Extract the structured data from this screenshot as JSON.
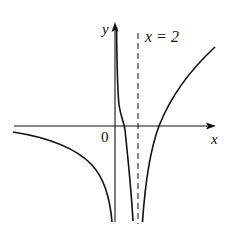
{
  "figure": {
    "type": "function-graph",
    "axes": {
      "x_label": "x",
      "y_label": "y",
      "origin_label": "0"
    },
    "asymptote": {
      "label": "x = 2",
      "style": "dashed",
      "x_value": 2
    },
    "curves": [
      {
        "name": "left-branch",
        "description": "approaches x-axis from below as x → -∞, decreases to -∞ as x → 0⁻"
      },
      {
        "name": "middle-branch",
        "description": "descends from +∞ near x = 0⁺, crosses x-axis, falls to -∞ as x → 2⁻"
      },
      {
        "name": "right-branch",
        "description": "rises from -∞ as x → 2⁺, crosses x-axis, increases"
      }
    ],
    "colors": {
      "stroke": "#111111",
      "background": "#ffffff"
    }
  }
}
